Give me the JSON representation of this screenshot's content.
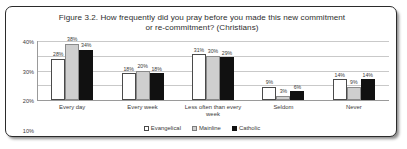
{
  "figure": {
    "title_line_1": "Figure 3.2. How frequently did you pray before you made this new commitment",
    "title_line_2": "or re-commitment? (Christians)"
  },
  "chart_data": {
    "type": "bar",
    "title": "Figure 3.2. How frequently did you pray before you made this new commitment or re-commitment? (Christians)",
    "xlabel": "",
    "ylabel": "",
    "ylim": [
      0,
      40
    ],
    "ytick_labels": [
      "40%",
      "30%",
      "20%",
      "10%",
      "0%"
    ],
    "ytick_values": [
      40,
      30,
      20,
      10,
      0
    ],
    "grid": true,
    "legend_position": "bottom",
    "categories": [
      "Every day",
      "Every week",
      "Less often than every week",
      "Seldom",
      "Never"
    ],
    "series": [
      {
        "name": "Evangelical",
        "color": "#ffffff",
        "values": [
          28,
          18,
          31,
          9,
          14
        ],
        "labels": [
          "28%",
          "18%",
          "31%",
          "9%",
          "14%"
        ]
      },
      {
        "name": "Mainline",
        "color": "#cfcfcf",
        "values": [
          38,
          20,
          30,
          3,
          9
        ],
        "labels": [
          "38%",
          "20%",
          "30%",
          "3%",
          "9%"
        ]
      },
      {
        "name": "Catholic",
        "color": "#111111",
        "values": [
          34,
          18,
          29,
          6,
          14
        ],
        "labels": [
          "34%",
          "18%",
          "29%",
          "6%",
          "14%"
        ]
      }
    ]
  }
}
